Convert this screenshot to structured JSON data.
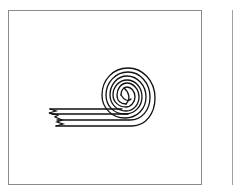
{
  "figure": {
    "stroke_color": "#111111",
    "border_color": "#8a8a8a",
    "background": "#ffffff"
  }
}
